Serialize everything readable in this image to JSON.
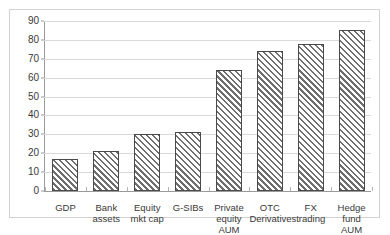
{
  "chart_data": {
    "type": "bar",
    "title": "",
    "subtitle": "",
    "xlabel": "",
    "ylabel": "",
    "categories": [
      "GDP",
      "Bank assets",
      "Equity mkt cap",
      "G-SIBs",
      "Private equity AUM",
      "OTC Derivatives",
      "FX trading",
      "Hedge fund AUM"
    ],
    "values": [
      17,
      21,
      30,
      31,
      64,
      74,
      78,
      85
    ],
    "ylim": [
      0,
      90
    ],
    "ytick_labels": [
      "0",
      "10",
      "20",
      "30",
      "40",
      "50",
      "60",
      "70",
      "80",
      "90"
    ],
    "yticks": [
      0,
      10,
      20,
      30,
      40,
      50,
      60,
      70,
      80,
      90
    ],
    "grid": true,
    "legend": false,
    "legend_position": "none",
    "bar_fill": "diagonal-hatch",
    "colors": {
      "bar_hatch": "#6e6e6e",
      "bar_background": "#ffffff",
      "bar_border": "#4a4a4a",
      "gridline": "#d9d9d9",
      "axis_line": "#9a9a9a",
      "frame_border": "#d2d2d2",
      "text": "#3a3a3a",
      "plot_background": "#ffffff"
    }
  }
}
